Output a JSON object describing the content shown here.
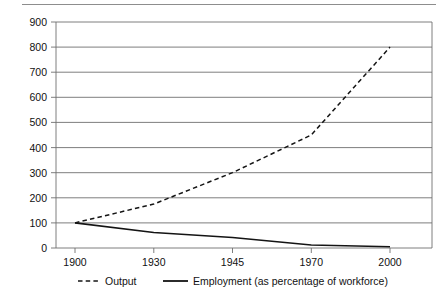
{
  "chart_data": {
    "type": "line",
    "title": "",
    "subtitle": "",
    "xlabel": "",
    "ylabel": "",
    "x": [
      "1900",
      "1930",
      "1945",
      "1970",
      "2000"
    ],
    "categories": [
      "1900",
      "1930",
      "1945",
      "1970",
      "2000"
    ],
    "series": [
      {
        "name": "Output",
        "style": "dashed",
        "color": "#141414",
        "values": [
          100,
          175,
          300,
          450,
          800
        ]
      },
      {
        "name": "Employment (as percentage of workforce)",
        "style": "solid",
        "color": "#141414",
        "values": [
          100,
          62,
          42,
          12,
          5
        ]
      }
    ],
    "ylim": [
      0,
      900
    ],
    "ytick_step": 100,
    "yticks": [
      "0",
      "100",
      "200",
      "300",
      "400",
      "500",
      "600",
      "700",
      "800",
      "900"
    ],
    "xticks": [
      "1900",
      "1930",
      "1945",
      "1970",
      "2000"
    ],
    "grid": true,
    "grid_axis": "y",
    "legend_position": "bottom",
    "legend": [
      {
        "label": "Output",
        "marker": "dashed-line"
      },
      {
        "label": "Employment (as percentage of workforce)",
        "marker": "solid-line"
      }
    ]
  },
  "figure": {
    "top_rule": true,
    "background": "#ffffff",
    "axis_color": "#6f6f6f",
    "text_color": "#111111"
  }
}
